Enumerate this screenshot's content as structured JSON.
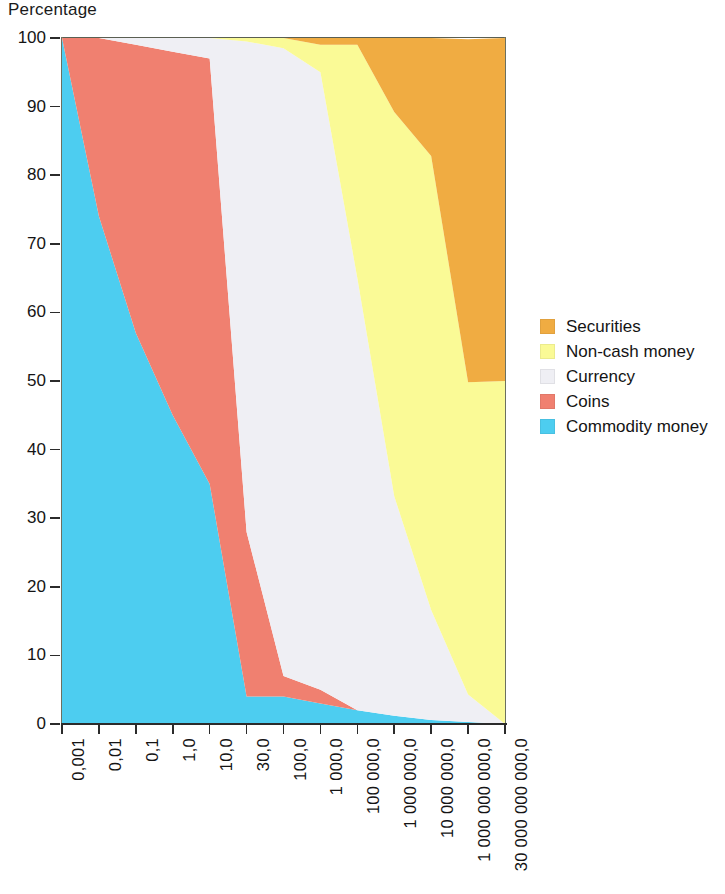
{
  "chart_data": {
    "type": "area",
    "title": "",
    "ylabel": "Percentage",
    "xlabel": "",
    "ylim": [
      0,
      100
    ],
    "y_ticks": [
      0,
      10,
      20,
      30,
      40,
      50,
      60,
      70,
      80,
      90,
      100
    ],
    "grid": false,
    "stacked": true,
    "stack_total": 100,
    "legend_position": "right",
    "x_scale": "log",
    "categories": [
      "0,001",
      "0,01",
      "0,1",
      "1,0",
      "10,0",
      "30,0",
      "100,0",
      "1 000,0",
      "100 000,0",
      "1 000 000,0",
      "10 000 000,0",
      "1 000 000 000,0",
      "30 000 000 000,0"
    ],
    "series": [
      {
        "name": "Commodity money",
        "color": "#4DCDF0",
        "values": [
          100,
          74,
          57,
          45,
          35,
          4,
          4,
          3,
          2,
          1.2,
          0.6,
          0.3,
          0
        ]
      },
      {
        "name": "Coins",
        "color": "#F08070",
        "values": [
          0,
          26,
          42,
          53,
          62,
          24,
          3,
          2,
          0,
          0,
          0,
          0,
          0
        ]
      },
      {
        "name": "Currency",
        "color": "#EFEFF4",
        "values": [
          0,
          0,
          1,
          2,
          3,
          71.5,
          91.5,
          90,
          63,
          32,
          16,
          4,
          0
        ]
      },
      {
        "name": "Non-cash money",
        "color": "#FAFA96",
        "values": [
          0,
          0,
          0,
          0,
          0,
          0.5,
          1.5,
          4,
          34,
          56,
          66.2,
          45.5,
          50
        ]
      },
      {
        "name": "Securities",
        "color": "#F0AC42",
        "values": [
          0,
          0,
          0,
          0,
          0,
          0,
          0,
          1,
          1,
          10.8,
          17.2,
          50,
          50
        ]
      }
    ]
  },
  "legend": {
    "items": [
      {
        "label": "Securities",
        "color": "#F0AC42"
      },
      {
        "label": "Non-cash money",
        "color": "#FAFA96"
      },
      {
        "label": "Currency",
        "color": "#EFEFF4"
      },
      {
        "label": "Coins",
        "color": "#F08070"
      },
      {
        "label": "Commodity money",
        "color": "#4DCDF0"
      }
    ]
  }
}
